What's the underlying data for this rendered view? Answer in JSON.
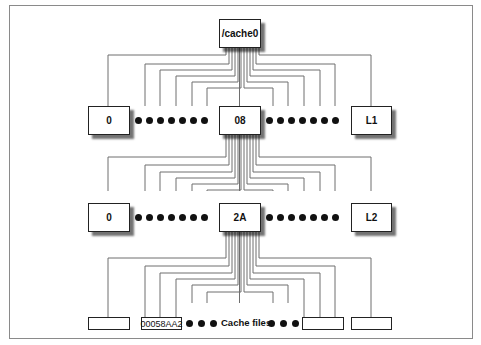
{
  "diagram": {
    "root": {
      "label": "/cache0"
    },
    "level1": {
      "first": {
        "label": "0"
      },
      "middle": {
        "label": "08"
      },
      "last": {
        "label": "L1"
      },
      "ellipsis_dots": 7
    },
    "level2": {
      "first": {
        "label": "0"
      },
      "middle": {
        "label": "2A"
      },
      "last": {
        "label": "L2"
      },
      "ellipsis_dots": 7
    },
    "leaves": {
      "items": [
        {
          "label": ""
        },
        {
          "label": "00058AA2"
        },
        {
          "label": ""
        },
        {
          "label": ""
        }
      ],
      "caption": "Cache files"
    },
    "colors": {
      "line": "#6e6e6e",
      "border": "#222222",
      "frame": "#8a8a8a"
    }
  }
}
